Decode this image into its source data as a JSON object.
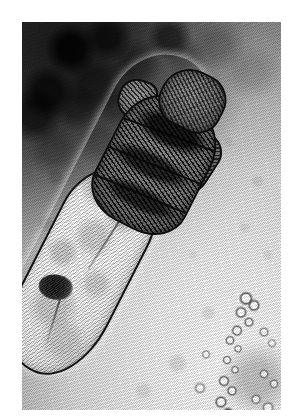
{
  "page": {
    "background_color": "#ffffff",
    "width": 297,
    "height": 420
  },
  "figure": {
    "type": "light-micrograph",
    "modality": "brightfield light microscopy, halftone-printed reproduction",
    "color_mode": "grayscale",
    "caption": "",
    "title": "",
    "scale_bar": "",
    "labels": [],
    "plate": {
      "left": 22,
      "top": 22,
      "width": 259,
      "height": 388,
      "border": "none",
      "margin_color": "#ffffff"
    },
    "background": {
      "description": "uneven illumination field; dark out-of-focus debris cloud in the upper-left quadrant grading to a bright pale field toward the lower-right",
      "dark_zone_color": "#1b1b1b",
      "mid_zone_color": "#9a9a98",
      "bright_zone_color": "#f2f2f0",
      "screen_pattern": "diagonal halftone ruling running lower-left to upper-right"
    },
    "specimen": {
      "orientation": "anterior (head) at upper right, posterior tip at lower left; long axis tilted about 27 degrees from vertical",
      "outline_color": "#141416",
      "body_fill_color": "#ececea",
      "parts": [
        {
          "name": "gnathosoma",
          "label": "gnathosoma (mouthparts)",
          "tone": "dark",
          "position": "anterior tip, upper right"
        },
        {
          "name": "podosoma",
          "label": "podosoma (leg-bearing region)",
          "tone": "dark, densely striated with stubby legs",
          "position": "upper third of the body"
        },
        {
          "name": "opisthosoma",
          "label": "opisthosoma (elongated tail)",
          "tone": "pale, finely annulated",
          "position": "lower two thirds, tapering to a rounded tip"
        },
        {
          "name": "dark-inclusion",
          "label": "dark granular inclusion",
          "tone": "near black",
          "position": "within the posterior third of the opisthosoma"
        }
      ]
    },
    "artifacts": [
      {
        "name": "debris-particle",
        "description": "small bright refractile particle left of the body"
      },
      {
        "name": "bubble-chain",
        "description": "chain of small vesicles / bubbles running diagonally across the lower right"
      },
      {
        "name": "smudge",
        "description": "diffuse grey smudge in the lower-right corner"
      }
    ]
  }
}
